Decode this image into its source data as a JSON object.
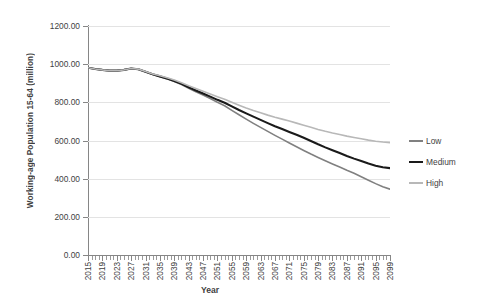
{
  "chart_data": {
    "type": "line",
    "title": "",
    "xlabel": "Year",
    "ylabel": "Working-age Population 15-64 (million)",
    "xlim": [
      2015,
      2099
    ],
    "ylim": [
      0,
      1200
    ],
    "ytick_step": 200,
    "ytick_labels": [
      "0.00",
      "200.00",
      "400.00",
      "600.00",
      "800.00",
      "1000.00",
      "1200.00"
    ],
    "ytick_values": [
      0,
      200,
      400,
      600,
      800,
      1000,
      1200
    ],
    "xtick_labels": [
      "2015",
      "2019",
      "2023",
      "2027",
      "2031",
      "2035",
      "2039",
      "2043",
      "2047",
      "2051",
      "2055",
      "2059",
      "2063",
      "2067",
      "2071",
      "2075",
      "2079",
      "2083",
      "2087",
      "2091",
      "2095",
      "2099"
    ],
    "xtick_values": [
      2015,
      2019,
      2023,
      2027,
      2031,
      2035,
      2039,
      2043,
      2047,
      2051,
      2055,
      2059,
      2063,
      2067,
      2071,
      2075,
      2079,
      2083,
      2087,
      2091,
      2095,
      2099
    ],
    "xtick_minor_step": 1,
    "grid": "horizontal",
    "legend_position": "right",
    "x": [
      2015,
      2017,
      2019,
      2021,
      2023,
      2025,
      2027,
      2029,
      2031,
      2033,
      2035,
      2037,
      2039,
      2041,
      2043,
      2045,
      2047,
      2049,
      2051,
      2053,
      2055,
      2057,
      2059,
      2061,
      2063,
      2065,
      2067,
      2069,
      2071,
      2073,
      2075,
      2077,
      2079,
      2081,
      2083,
      2085,
      2087,
      2089,
      2091,
      2093,
      2095,
      2097,
      2099
    ],
    "series": [
      {
        "name": "Low",
        "color": "#808080",
        "width": 1.6,
        "values": [
          981,
          975,
          970,
          966,
          966,
          970,
          977,
          973,
          960,
          946,
          934,
          923,
          909,
          893,
          874,
          855,
          838,
          820,
          800,
          782,
          758,
          735,
          712,
          690,
          669,
          648,
          627,
          607,
          587,
          567,
          548,
          529,
          511,
          494,
          477,
          461,
          444,
          428,
          410,
          392,
          374,
          358,
          345
        ]
      },
      {
        "name": "Medium",
        "color": "#1a1a1a",
        "width": 2.1,
        "values": [
          981,
          975,
          970,
          966,
          966,
          970,
          977,
          973,
          960,
          947,
          936,
          925,
          912,
          897,
          879,
          862,
          846,
          830,
          813,
          798,
          779,
          760,
          742,
          725,
          708,
          691,
          675,
          660,
          645,
          630,
          614,
          597,
          580,
          564,
          549,
          534,
          519,
          505,
          492,
          479,
          468,
          460,
          455
        ]
      },
      {
        "name": "High",
        "color": "#b8b8b8",
        "width": 1.6,
        "values": [
          981,
          975,
          970,
          966,
          966,
          970,
          977,
          974,
          962,
          949,
          939,
          929,
          917,
          903,
          887,
          872,
          858,
          844,
          829,
          816,
          800,
          785,
          770,
          757,
          745,
          733,
          722,
          712,
          702,
          691,
          680,
          669,
          658,
          648,
          639,
          631,
          623,
          616,
          609,
          602,
          596,
          592,
          589
        ]
      }
    ]
  },
  "legend": {
    "items": [
      {
        "label": "Low"
      },
      {
        "label": "Medium"
      },
      {
        "label": "High"
      }
    ]
  }
}
